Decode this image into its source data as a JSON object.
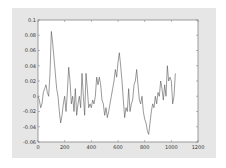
{
  "chart_data": {
    "type": "line",
    "title": "",
    "xlabel": "",
    "ylabel": "",
    "xlim": [
      0,
      1200
    ],
    "ylim": [
      -0.06,
      0.1
    ],
    "grid": false,
    "legend": null,
    "x_ticks": [
      "0",
      "200",
      "400",
      "600",
      "800",
      "1000",
      "1200"
    ],
    "y_ticks": [
      "0.1",
      "0.08",
      "0.06",
      "0.04",
      "0.02",
      "0",
      "-0.02",
      "-0.04",
      "-0.06"
    ],
    "series": [
      {
        "name": "signal",
        "color": "#555555",
        "x": [
          0,
          10,
          20,
          30,
          40,
          50,
          60,
          70,
          80,
          90,
          100,
          110,
          120,
          130,
          140,
          150,
          160,
          170,
          180,
          190,
          200,
          210,
          220,
          230,
          240,
          250,
          260,
          270,
          280,
          290,
          300,
          310,
          320,
          330,
          340,
          350,
          360,
          370,
          380,
          390,
          400,
          410,
          420,
          430,
          440,
          450,
          460,
          470,
          480,
          490,
          500,
          510,
          520,
          530,
          540,
          550,
          560,
          570,
          580,
          590,
          600,
          610,
          620,
          630,
          640,
          650,
          660,
          670,
          680,
          690,
          700,
          710,
          720,
          730,
          740,
          750,
          760,
          770,
          780,
          790,
          800,
          810,
          820,
          830,
          840,
          850,
          860,
          870,
          880,
          890,
          900,
          910,
          920,
          930,
          940,
          950,
          960,
          970,
          980,
          990,
          1000,
          1010,
          1020,
          1030
        ],
        "values": [
          0,
          -0.005,
          -0.015,
          -0.01,
          0.005,
          0.01,
          0.015,
          0.005,
          0.0,
          0.03,
          0.085,
          0.07,
          0.05,
          0.03,
          0.01,
          0.0,
          -0.02,
          -0.035,
          -0.025,
          -0.01,
          0.0,
          -0.02,
          0.005,
          0.038,
          0.02,
          -0.01,
          0.0,
          -0.02,
          0.01,
          -0.025,
          -0.01,
          0.0,
          -0.015,
          0.03,
          0.0,
          -0.025,
          0.03,
          0.01,
          -0.015,
          -0.01,
          -0.015,
          -0.005,
          -0.01,
          0.0,
          0.025,
          0.015,
          0.025,
          0.015,
          -0.005,
          -0.01,
          -0.025,
          -0.015,
          -0.028,
          -0.02,
          -0.01,
          0.0,
          0.01,
          0.02,
          0.035,
          0.025,
          0.045,
          0.057,
          0.04,
          0.02,
          -0.005,
          -0.028,
          -0.015,
          -0.02,
          0.01,
          -0.02,
          -0.01,
          -0.005,
          0.015,
          0.02,
          0.035,
          0.015,
          -0.005,
          -0.01,
          0.0,
          -0.02,
          -0.03,
          -0.035,
          -0.045,
          -0.05,
          -0.035,
          -0.02,
          -0.01,
          -0.015,
          0.0,
          -0.01,
          0.005,
          0.0,
          0.02,
          0.01,
          -0.005,
          0.015,
          0.0,
          0.04,
          0.02,
          0.025,
          0.02,
          -0.01,
          0.0,
          0.03
        ]
      }
    ]
  },
  "colors": {
    "panel": "#e6e6e6",
    "plot_bg": "#ffffff",
    "axis": "#777777",
    "line": "#555555"
  }
}
